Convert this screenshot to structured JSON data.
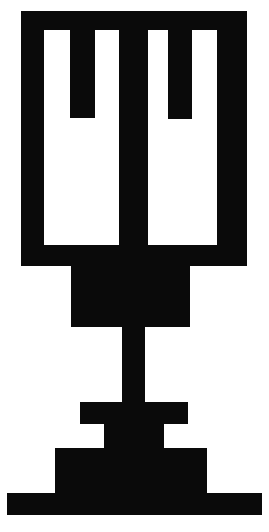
{
  "canvas": {
    "width": 269,
    "height": 532,
    "background_color": "#ffffff",
    "ink_color": "#0a0a0a",
    "title": "Candelabra Emblem"
  },
  "graphic": {
    "name": "stepped-pedestal-candelabra-symbol",
    "description": "Solid black pictographic emblem: a rectangular head containing four white vertical slots forming two U shapes, supported by a tapered neck, a narrow stem, and a three-tier stepped base.",
    "style": "solid silhouette",
    "fill_color": "#0a0a0a",
    "stroke": "none",
    "parts": [
      {
        "name": "head-block",
        "kind": "rectangle",
        "x": 21,
        "y": 11,
        "width": 226,
        "height": 255
      },
      {
        "name": "slot-1-white",
        "kind": "rectangle-cutout",
        "x": 44,
        "y": 30,
        "width": 26,
        "height": 215
      },
      {
        "name": "slot-2-white",
        "kind": "rectangle-cutout",
        "x": 95,
        "y": 30,
        "width": 24,
        "height": 215
      },
      {
        "name": "slot-3-white",
        "kind": "rectangle-cutout",
        "x": 148,
        "y": 30,
        "width": 20,
        "height": 215
      },
      {
        "name": "slot-4-white",
        "kind": "rectangle-cutout",
        "x": 192,
        "y": 30,
        "width": 25,
        "height": 215
      },
      {
        "name": "prong-left-short",
        "kind": "black-bridge",
        "x": 70,
        "y": 30,
        "width": 25,
        "height": 88
      },
      {
        "name": "prong-right-short",
        "kind": "black-bridge",
        "x": 168,
        "y": 30,
        "width": 24,
        "height": 89
      },
      {
        "name": "center-pillar",
        "kind": "black-bridge",
        "x": 119,
        "y": 11,
        "width": 29,
        "height": 255
      },
      {
        "name": "neck-shoulder",
        "kind": "rectangle",
        "x": 71,
        "y": 266,
        "width": 119,
        "height": 61
      },
      {
        "name": "stem",
        "kind": "rectangle",
        "x": 122,
        "y": 327,
        "width": 23,
        "height": 75
      },
      {
        "name": "base-tier-1",
        "kind": "rectangle",
        "x": 80,
        "y": 402,
        "width": 108,
        "height": 22
      },
      {
        "name": "base-tier-1-riser",
        "kind": "rectangle",
        "x": 104,
        "y": 424,
        "width": 60,
        "height": 24
      },
      {
        "name": "base-tier-2",
        "kind": "rectangle",
        "x": 55,
        "y": 448,
        "width": 152,
        "height": 46
      },
      {
        "name": "base-tier-3",
        "kind": "rectangle",
        "x": 7,
        "y": 493,
        "width": 255,
        "height": 22
      }
    ],
    "slot_count": 4,
    "prong_count": 2,
    "base_tier_count": 3
  }
}
